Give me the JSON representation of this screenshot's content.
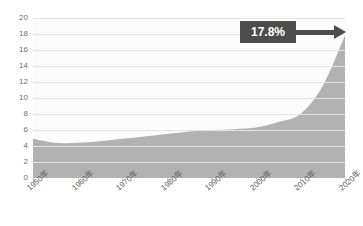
{
  "chart_data": {
    "type": "area",
    "title": "",
    "xlabel": "",
    "ylabel": "",
    "ylim": [
      0,
      20
    ],
    "grid": true,
    "legend": "none",
    "y_ticks": [
      "20",
      "18",
      "16",
      "14",
      "12",
      "10",
      "8",
      "6",
      "4",
      "2",
      "0"
    ],
    "y_tick_values": [
      20,
      18,
      16,
      14,
      12,
      10,
      8,
      6,
      4,
      2,
      0
    ],
    "categories": [
      "1950年",
      "1960年",
      "1970年",
      "1980年",
      "1990年",
      "2000年",
      "2010年",
      "2020年"
    ],
    "x": [
      1950,
      1960,
      1970,
      1980,
      1990,
      2000,
      2010,
      2020
    ],
    "values": [
      4.9,
      4.4,
      4.8,
      5.5,
      6.0,
      6.3,
      8.0,
      17.8
    ],
    "series": [
      {
        "name": "",
        "points": [
          {
            "x": 1950,
            "y": 4.9
          },
          {
            "x": 1955,
            "y": 4.4
          },
          {
            "x": 1960,
            "y": 4.4
          },
          {
            "x": 1965,
            "y": 4.6
          },
          {
            "x": 1970,
            "y": 4.9
          },
          {
            "x": 1975,
            "y": 5.2
          },
          {
            "x": 1980,
            "y": 5.5
          },
          {
            "x": 1985,
            "y": 5.8
          },
          {
            "x": 1990,
            "y": 6.0
          },
          {
            "x": 1995,
            "y": 6.1
          },
          {
            "x": 2000,
            "y": 6.3
          },
          {
            "x": 2005,
            "y": 7.0
          },
          {
            "x": 2010,
            "y": 8.0
          },
          {
            "x": 2015,
            "y": 11.5
          },
          {
            "x": 2020,
            "y": 17.8
          }
        ]
      }
    ],
    "annotations": [
      {
        "label": "17.8%",
        "points_to_x": 2020,
        "points_to_y": 17.8,
        "style": "boxed-arrow"
      }
    ],
    "colors": {
      "area_fill": "#b2b2b2",
      "annotation_box": "#4d4d4d",
      "annotation_text": "#ffffff",
      "gridline": "#e3e3e3",
      "axis_text": "#6e6e6e",
      "plot_background": "#fcfcfc",
      "page_background": "#ffffff"
    }
  },
  "annotation": {
    "value_label": "17.8%"
  },
  "axes": {
    "y_labels": [
      "20",
      "18",
      "16",
      "14",
      "12",
      "10",
      "8",
      "6",
      "4",
      "2",
      "0"
    ],
    "x_labels": [
      "1950年",
      "1960年",
      "1970年",
      "1980年",
      "1990年",
      "2000年",
      "2010年",
      "2020年"
    ]
  }
}
